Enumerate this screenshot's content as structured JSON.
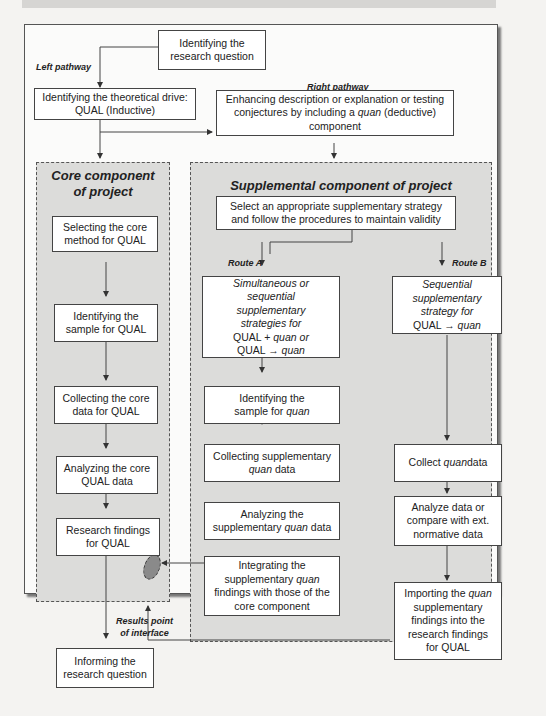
{
  "labels": {
    "left_pathway": "Left pathway",
    "right_pathway": "Right pathway",
    "route_a": "Route A",
    "route_b": "Route B",
    "results_point_1": "Results point",
    "results_point_2": "of interface"
  },
  "regions": {
    "core_title_1": "Core component",
    "core_title_2": "of project",
    "supplemental_title": "Supplemental component of project"
  },
  "boxes": {
    "research_question_1": "Identifying the",
    "research_question_2": "research question",
    "theoretical_drive_1": "Identifying the theoretical drive:",
    "theoretical_drive_2": "QUAL (Inductive)",
    "enhancing_1": "Enhancing description or explanation or testing",
    "enhancing_2a": "conjectures by including a ",
    "enhancing_2b": "quan",
    "enhancing_2c": " (deductive)",
    "enhancing_3": "component",
    "core_method_1": "Selecting the core",
    "core_method_2": "method for QUAL",
    "sample_qual_1": "Identifying the",
    "sample_qual_2": "sample for QUAL",
    "collect_core_1": "Collecting the core",
    "collect_core_2": "data for QUAL",
    "analyze_core_1": "Analyzing the core",
    "analyze_core_2": "QUAL data",
    "findings_qual_1": "Research findings",
    "findings_qual_2": "for QUAL",
    "informing_1": "Informing the",
    "informing_2": "research question",
    "select_strategy_1": "Select an appropriate supplementary strategy",
    "select_strategy_2": "and follow the procedures to maintain validity",
    "route_a_strategy_1": "Simultaneous or",
    "route_a_strategy_2": "sequential",
    "route_a_strategy_3": "supplementary",
    "route_a_strategy_4": "strategies for",
    "route_a_strategy_5a": "QUAL + ",
    "route_a_strategy_5b": "quan or",
    "route_a_strategy_6a": "QUAL → ",
    "route_a_strategy_6b": "quan",
    "route_b_strategy_1": "Sequential",
    "route_b_strategy_2": "supplementary",
    "route_b_strategy_3": "strategy for",
    "route_b_strategy_4a": "QUAL → ",
    "route_b_strategy_4b": "quan",
    "sample_quan_1": "Identifying the",
    "sample_quan_2a": "sample for ",
    "sample_quan_2b": "quan",
    "collect_supp_1": "Collecting supplementary",
    "collect_supp_2a": "quan",
    "collect_supp_2b": " data",
    "analyze_supp_1": "Analyzing the",
    "analyze_supp_2a": "supplementary ",
    "analyze_supp_2b": "quan",
    "analyze_supp_2c": " data",
    "integrate_1": "Integrating the",
    "integrate_2a": "supplementary ",
    "integrate_2b": "quan",
    "integrate_3": "findings with those of the",
    "integrate_4": "core component",
    "collect_quan_a": "Collect ",
    "collect_quan_b": "quan",
    "collect_quan_c": " data",
    "analyze_ext_1": "Analyze data or",
    "analyze_ext_2": "compare with ext.",
    "analyze_ext_3": "normative data",
    "importing_1a": "Importing the ",
    "importing_1b": "quan",
    "importing_2": "supplementary",
    "importing_3": "findings into the",
    "importing_4": "research findings",
    "importing_5": "for QUAL"
  },
  "colors": {
    "region_fill": "#dcdcda",
    "interface_node": "#8a8a8a",
    "stroke": "#444444"
  }
}
